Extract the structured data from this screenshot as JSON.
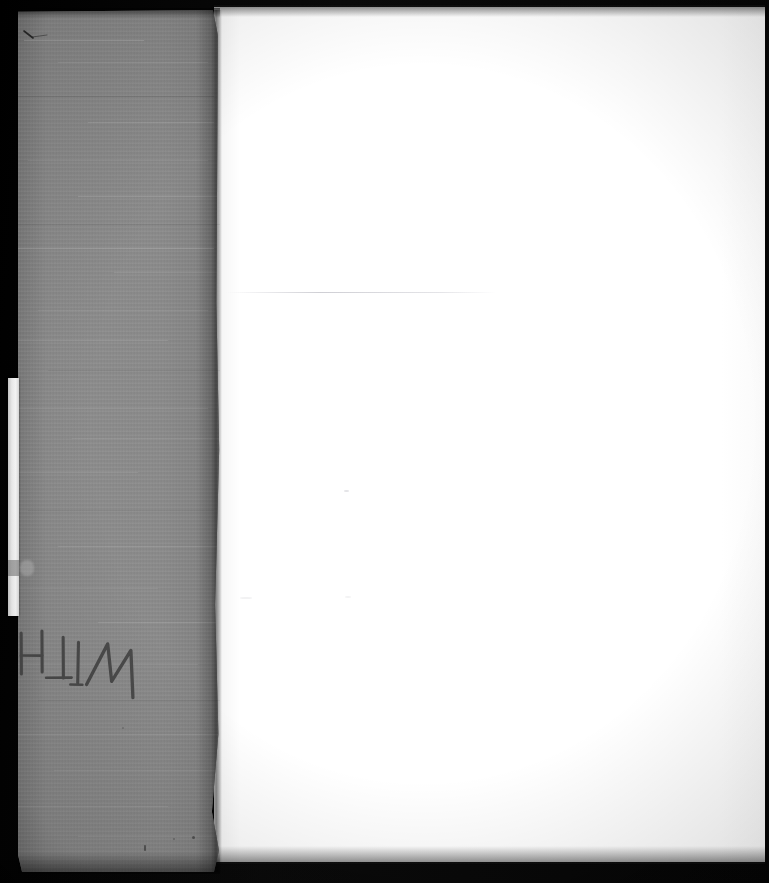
{
  "scan": {
    "title": "Scanned book interior - gray cloth cover and blank recto page",
    "width_px": 769,
    "height_px": 883,
    "background_color": "#000000"
  },
  "cover": {
    "label": "gray cloth book cover",
    "color": "#8a8a8a",
    "edge_color": "#7e7e7e",
    "position": {
      "left_px": 18,
      "top_px": 10,
      "width_px": 202,
      "height_px": 862
    }
  },
  "page": {
    "label": "blank white page",
    "color": "#fdfdfd",
    "position": {
      "left_px": 214,
      "top_px": 7,
      "width_px": 551,
      "height_px": 855
    },
    "content": ""
  },
  "edge_sliver": {
    "label": "white page block edge",
    "color": "#f4f4f4",
    "position": {
      "left_px": 8,
      "top_px": 378,
      "width_px": 11,
      "height_px": 238
    }
  },
  "annotation": {
    "text": "WITH",
    "style": "handwritten pencil, inverted",
    "rotation_deg": 191,
    "ink_color": "#4a4a4a",
    "position": {
      "left_px": 16,
      "top_px": 608
    }
  },
  "marks": [
    {
      "name": "corner-scratch",
      "left_px": 23,
      "top_px": 26
    },
    {
      "name": "cover-speck",
      "left_px": 20,
      "top_px": 565
    },
    {
      "name": "cover-dot",
      "left_px": 144,
      "top_px": 845
    },
    {
      "name": "page-speck",
      "left_px": 344,
      "top_px": 490
    }
  ],
  "colors": {
    "backdrop": "#000000",
    "cover_gray": "#8a8a8a",
    "page_white": "#fdfdfd",
    "ink": "#4a4a4a"
  }
}
